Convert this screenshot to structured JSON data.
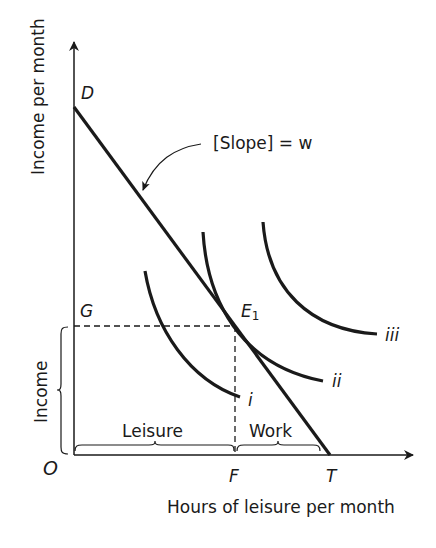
{
  "diagram": {
    "y_axis_label": "Income per month",
    "x_axis_label": "Hours of leisure per month",
    "origin_label": "O",
    "points": {
      "D": "D",
      "G": "G",
      "E1_main": "E",
      "E1_sub": "1",
      "F": "F",
      "T": "T"
    },
    "slope_annotation": "[Slope] = w",
    "curves": [
      "i",
      "ii",
      "iii"
    ],
    "braces": {
      "income": "Income",
      "leisure": "Leisure",
      "work": "Work"
    },
    "colors": {
      "ink": "#1a1a1a",
      "background": "#ffffff"
    }
  }
}
